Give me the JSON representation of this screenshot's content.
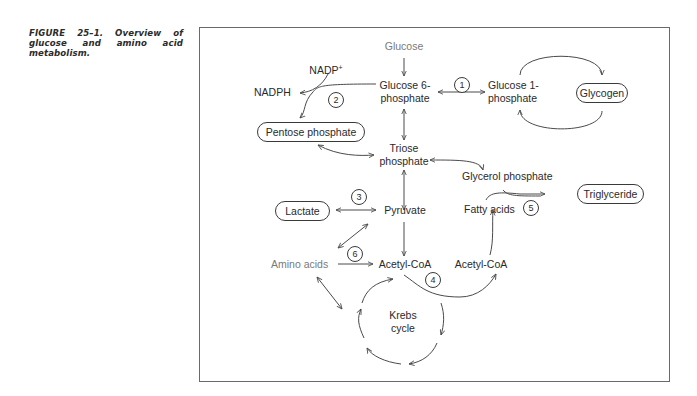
{
  "figure": {
    "caption": "FIGURE 25–1. Overview of glucose and amino acid metabolism."
  },
  "nodes": {
    "glucose": "Glucose",
    "glucose6p_line1": "Glucose 6-",
    "glucose6p_line2": "phosphate",
    "glucose1p_line1": "Glucose 1-",
    "glucose1p_line2": "phosphate",
    "glycogen": "Glycogen",
    "nadp": "NADP",
    "nadp_sup": "+",
    "nadph": "NADPH",
    "pentose_phosphate": "Pentose phosphate",
    "triose_line1": "Triose",
    "triose_line2": "phosphate",
    "glycerol_phosphate": "Glycerol phosphate",
    "triglyceride": "Triglyceride",
    "fatty_acids": "Fatty acids",
    "lactate": "Lactate",
    "pyruvate": "Pyruvate",
    "amino_acids": "Amino acids",
    "acetyl_coa_main": "Acetyl-CoA",
    "acetyl_coa_right": "Acetyl-CoA",
    "krebs_line1": "Krebs",
    "krebs_line2": "cycle"
  },
  "steps": [
    "1",
    "2",
    "3",
    "4",
    "5",
    "6"
  ],
  "colors": {
    "line": "#4a4a4a",
    "text": "#2a2a2a",
    "muted_text": "#7a7a7a",
    "frame": "#6a6a6a"
  }
}
